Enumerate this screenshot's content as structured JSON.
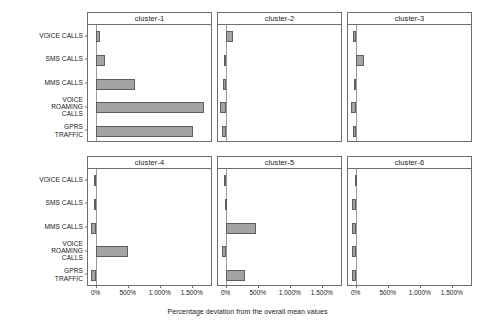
{
  "caption": "Percentage deviation from the overall mean values",
  "chart_data": {
    "type": "bar",
    "title": "",
    "subtitle": "",
    "xlabel": "Percentage deviation from the overall mean values",
    "ylabel": "",
    "orientation": "horizontal",
    "faceted": true,
    "facet_layout": [
      2,
      3
    ],
    "grid": false,
    "legend": "none",
    "xlim": [
      -120,
      1800
    ],
    "xticks": [
      0,
      500,
      1000,
      1500
    ],
    "xtick_labels": [
      "0%",
      "500%",
      "1.000%",
      "1.500%"
    ],
    "categories": [
      "VOICE CALLS",
      "SMS CALLS",
      "MMS CALLS",
      "VOICE\nROAMING\nCALLS",
      "GPRS\nTRAFFIC"
    ],
    "panels": [
      {
        "name": "cluster-1",
        "values": [
          60,
          145,
          610,
          1690,
          1520
        ]
      },
      {
        "name": "cluster-2",
        "values": [
          118,
          -25,
          -45,
          -90,
          -50
        ]
      },
      {
        "name": "cluster-3",
        "values": [
          -35,
          130,
          -30,
          -70,
          -45
        ]
      },
      {
        "name": "cluster-4",
        "values": [
          -22,
          -20,
          -75,
          505,
          -70
        ]
      },
      {
        "name": "cluster-5",
        "values": [
          -25,
          -15,
          470,
          -55,
          300
        ]
      },
      {
        "name": "cluster-6",
        "values": [
          -18,
          -52,
          -58,
          -60,
          -62
        ]
      }
    ]
  }
}
